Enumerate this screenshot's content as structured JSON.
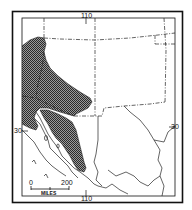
{
  "map": {
    "type": "species range map",
    "region": "southwestern United States and northwestern Mexico",
    "colors": {
      "frame": "#111111",
      "range_fill": "#555555",
      "line": "#222222",
      "background": "#ffffff"
    },
    "graticule": {
      "longitude_top": "110",
      "longitude_bottom": "110",
      "latitude_left": "30",
      "latitude_right": "30"
    },
    "scale_bar": {
      "start": "0",
      "end": "200",
      "unit": "MILES"
    },
    "legend": {
      "range_symbol": "stippled-shading"
    }
  }
}
